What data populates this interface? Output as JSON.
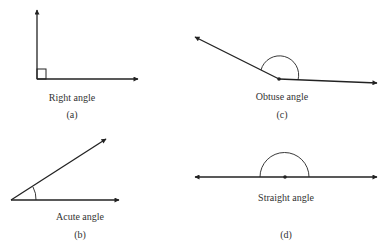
{
  "figure": {
    "panels": [
      {
        "id": "a",
        "name": "Right angle",
        "label": "Right angle",
        "tag": "(a)"
      },
      {
        "id": "b",
        "name": "Acute angle",
        "label": "Acute angle",
        "tag": "(b)"
      },
      {
        "id": "c",
        "name": "Obtuse angle",
        "label": "Obtuse angle",
        "tag": "(c)"
      },
      {
        "id": "d",
        "name": "Straight angle",
        "label": "Straight angle",
        "tag": "(d)"
      }
    ],
    "colors": {
      "stroke": "#222222",
      "background": "#ffffff"
    }
  }
}
